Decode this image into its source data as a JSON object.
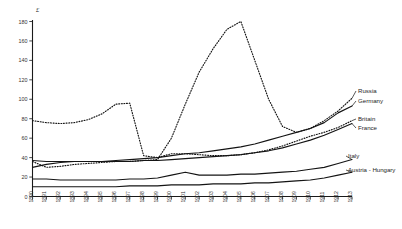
{
  "chart_data": {
    "type": "line",
    "title": "",
    "subtitle": "",
    "xlabel": "",
    "ylabel": "£",
    "unit_symbol": "£",
    "grid": false,
    "legend_position": "right-inline-labels",
    "xlim": [
      1890,
      1913
    ],
    "ylim": [
      0,
      180
    ],
    "ytick_step": 20,
    "yticks": [
      0,
      20,
      40,
      60,
      80,
      100,
      120,
      140,
      160,
      180
    ],
    "x": [
      1890,
      1891,
      1892,
      1893,
      1894,
      1895,
      1896,
      1897,
      1898,
      1899,
      1900,
      1901,
      1902,
      1903,
      1904,
      1905,
      1906,
      1907,
      1908,
      1909,
      1910,
      1911,
      1912,
      1913
    ],
    "xticklabels": [
      "1890",
      "1891",
      "1892",
      "1893",
      "1894",
      "1895",
      "1896",
      "1897",
      "1898",
      "1899",
      "1900",
      "1901",
      "1902",
      "1903",
      "1904",
      "1905",
      "1906",
      "1907",
      "1908",
      "1909",
      "1910",
      "1911",
      "1912",
      "1913"
    ],
    "series": [
      {
        "name": "Russia",
        "style": "dotted",
        "values": [
          36,
          30,
          31,
          33,
          34,
          35,
          36,
          36,
          37,
          38,
          60,
          95,
          128,
          152,
          172,
          180,
          140,
          100,
          72,
          66,
          70,
          78,
          88,
          101
        ]
      },
      {
        "name": "Germany",
        "style": "solid",
        "values": [
          30,
          33,
          35,
          36,
          36,
          36,
          37,
          38,
          39,
          40,
          42,
          44,
          45,
          47,
          49,
          51,
          54,
          58,
          62,
          66,
          70,
          76,
          86,
          93
        ]
      },
      {
        "name": "Britain",
        "style": "dotted",
        "values": [
          78,
          76,
          75,
          76,
          79,
          85,
          95,
          96,
          42,
          40,
          44,
          44,
          43,
          42,
          42,
          43,
          45,
          48,
          52,
          57,
          62,
          66,
          71,
          78
        ]
      },
      {
        "name": "France",
        "style": "solid",
        "values": [
          37,
          36,
          36,
          36,
          36,
          36,
          36,
          36,
          37,
          37,
          38,
          39,
          40,
          41,
          42,
          43,
          45,
          47,
          50,
          54,
          58,
          63,
          69,
          75
        ]
      },
      {
        "name": "Italy",
        "style": "solid",
        "values": [
          18,
          18,
          17,
          17,
          17,
          17,
          17,
          18,
          18,
          19,
          22,
          25,
          22,
          22,
          22,
          23,
          23,
          24,
          25,
          26,
          28,
          30,
          34,
          38
        ]
      },
      {
        "name": "Austria - Hungary",
        "style": "solid",
        "values": [
          10,
          10,
          10,
          10,
          10,
          10,
          10,
          11,
          11,
          11,
          12,
          12,
          12,
          13,
          13,
          13,
          14,
          14,
          15,
          16,
          17,
          19,
          22,
          25
        ]
      }
    ],
    "peaks": {
      "russia_peak_value": 180,
      "russia_peak_year": 1905,
      "germany_plateau_value": 128,
      "britain_high_value": 96
    }
  },
  "legend": {
    "items": [
      {
        "label": "Russia"
      },
      {
        "label": "Germany"
      },
      {
        "label": "Britain"
      },
      {
        "label": "France"
      },
      {
        "label": "Italy"
      },
      {
        "label": "Austria - Hungary"
      }
    ]
  }
}
